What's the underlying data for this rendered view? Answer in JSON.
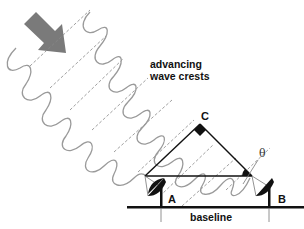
{
  "diagram": {
    "caption_line1": "advancing",
    "caption_line2": "wave crests",
    "vertex_c": "C",
    "antenna_a": "A",
    "antenna_b": "B",
    "angle": "θ",
    "baseline": "baseline",
    "arrow": "incoming-direction-arrow",
    "colors": {
      "arrow": "#7a7a7a",
      "wave": "#9a9a9a",
      "dashed": "#888888",
      "lines": "#111111"
    }
  }
}
